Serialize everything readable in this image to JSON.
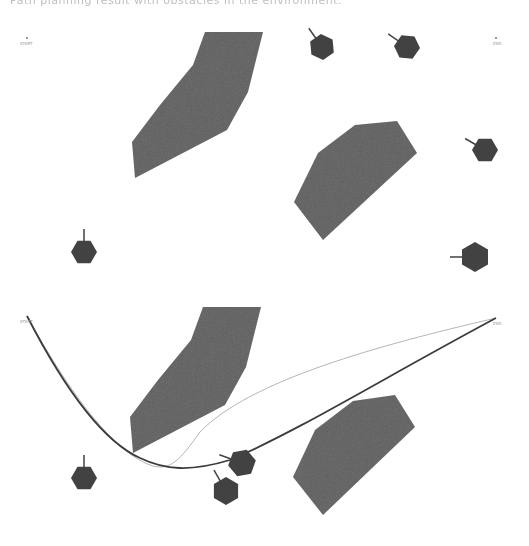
{
  "caption": "Path planning result with obstacles in the environment.",
  "colors": {
    "obstacle": "#5f5f5f",
    "agent": "#424242",
    "path_main": "#3c3c3c",
    "path_alt": "#b5b5b5",
    "background": "#ffffff"
  },
  "panels": [
    {
      "name": "environment",
      "start_label": "START",
      "end_label": "END",
      "start": [
        27,
        42
      ],
      "end": [
        496,
        42
      ],
      "obstacles": [
        "205,32 263,32 248,92 227,130 135,178 132,142 160,105 193,65",
        "355,125 397,121 417,153 323,240 294,202 318,153"
      ],
      "agents": [
        {
          "cx": 322,
          "cy": 47,
          "r": 13,
          "heading": 235
        },
        {
          "cx": 407,
          "cy": 47,
          "r": 13,
          "heading": 215
        },
        {
          "cx": 485,
          "cy": 150,
          "r": 13,
          "heading": 210
        },
        {
          "cx": 84,
          "cy": 252,
          "r": 13,
          "heading": 270
        },
        {
          "cx": 475,
          "cy": 257,
          "r": 15,
          "heading": 180
        }
      ]
    },
    {
      "name": "planned-paths",
      "start_label": "START",
      "end_label": "END",
      "start": [
        27,
        316
      ],
      "end": [
        496,
        318
      ],
      "obstacles": [
        "203,307 261,307 246,367 225,405 133,453 130,417 158,380 191,340",
        "353,401 395,395 415,427 323,515 293,477 315,430"
      ],
      "agents": [
        {
          "cx": 84,
          "cy": 478,
          "r": 13,
          "heading": 270
        },
        {
          "cx": 242,
          "cy": 463,
          "r": 14,
          "heading": 200
        },
        {
          "cx": 226,
          "cy": 491,
          "r": 14,
          "heading": 240
        }
      ],
      "paths": {
        "main": "M27,316 C60,380 100,440 140,458 C165,470 190,472 230,460 C300,430 380,380 496,318",
        "alt": "M27,316 C65,385 110,450 150,465 C170,472 180,460 200,432 C250,380 380,345 496,318"
      }
    }
  ]
}
